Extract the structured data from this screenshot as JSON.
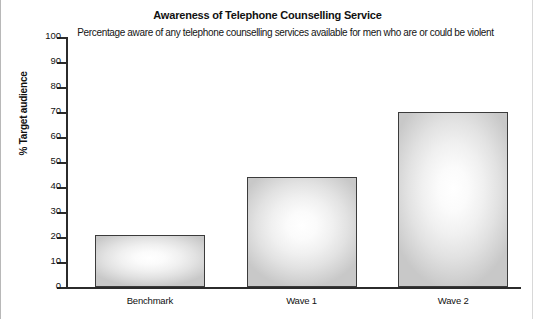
{
  "chart_data": {
    "type": "bar",
    "title": "Awareness of Telephone Counselling Service",
    "subtitle": "Percentage aware of any telephone counselling services available for men who are or could be violent",
    "xlabel": "",
    "ylabel": "% Target audience",
    "ylim": [
      0,
      100
    ],
    "ytick_step": 10,
    "yticks": [
      100,
      90,
      80,
      70,
      60,
      50,
      40,
      30,
      20,
      10,
      0
    ],
    "ytick_labels": [
      "100",
      "90",
      "80",
      "70",
      "60",
      "50",
      "40",
      "30",
      "20",
      "10",
      "0"
    ],
    "categories": [
      "Benchmark",
      "Wave 1",
      "Wave 2"
    ],
    "values": [
      21,
      44,
      70
    ],
    "grid": false,
    "legend": false,
    "bar_edge_color": "#3b3b3b",
    "bar_fill_center_color": "#ffffff",
    "bar_fill_edge_color": "#c8c8c8",
    "axis_color": "#2b2b2b",
    "background_color": "#ffffff"
  }
}
